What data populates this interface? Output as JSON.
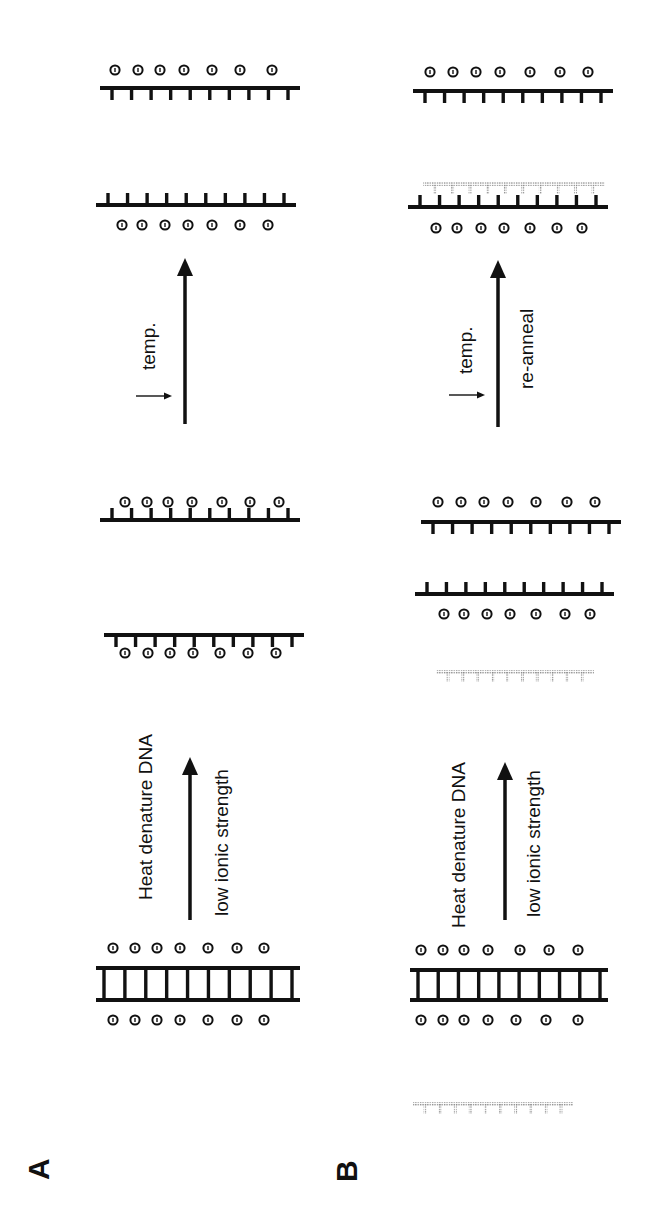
{
  "figure": {
    "width": 647,
    "height": 1213,
    "orientation": "rotated -90deg (reads bottom-to-top)",
    "colors": {
      "ink": "#111111",
      "stipple": "#8a8a8a",
      "background": "#ffffff"
    }
  },
  "panels": [
    {
      "id": "A",
      "letter": "A",
      "letter_pos": [
        22,
        1180
      ],
      "labels": [
        {
          "name": "heat-denature-label",
          "text": "Heat denature DNA",
          "pos": [
            135,
            900
          ]
        },
        {
          "name": "low-ionic-strength-label",
          "text": "low ionic strength",
          "pos": [
            211,
            916
          ]
        },
        {
          "name": "temp-label",
          "text": "temp.",
          "pos": [
            138,
            370
          ]
        }
      ],
      "arrows": [
        {
          "name": "denature-arrow",
          "x": 190,
          "y1": 920,
          "y2": 757,
          "width": 3.5
        },
        {
          "name": "cool-arrow",
          "x": 185,
          "y1": 424,
          "y2": 258,
          "width": 3.5
        }
      ],
      "small_arrows": [
        {
          "name": "temp-decrease-arrow",
          "x1": 136,
          "x2": 172,
          "y": 396
        }
      ],
      "duplexes": [
        {
          "name": "double-stranded-dna",
          "x1": 96,
          "x2": 300,
          "y_top": 968,
          "y_bot": 1000,
          "rungs": 10,
          "ions_above": [
            113,
            135,
            157,
            180,
            208,
            237,
            264
          ],
          "ions_above_y": 948,
          "ions_below": [
            113,
            135,
            157,
            180,
            208,
            237,
            264
          ],
          "ions_below_y": 1020
        }
      ],
      "strands": [
        {
          "name": "single-strand-lower",
          "x1": 100,
          "x2": 300,
          "y": 520,
          "teeth": "up",
          "tooth_len": 12,
          "count": 10,
          "style": "solid",
          "ions": [
            125,
            148,
            170,
            193,
            220,
            248,
            276
          ],
          "ions_side": "below",
          "ions_y": 653
        },
        {
          "name": "single-strand-upper",
          "x1": 104,
          "x2": 304,
          "y": 635,
          "teeth": "down",
          "tooth_len": 12,
          "count": 10,
          "style": "solid",
          "ions": [
            125,
            147,
            168,
            192,
            222,
            250,
            279
          ],
          "ions_side": "above",
          "ions_y": 502
        },
        {
          "name": "renatured-strand-lower",
          "x1": 96,
          "x2": 296,
          "y": 205,
          "teeth": "up",
          "tooth_len": 12,
          "count": 10,
          "style": "solid",
          "ions": [
            122,
            142,
            165,
            188,
            212,
            240,
            268
          ],
          "ions_side": "below",
          "ions_y": 225
        },
        {
          "name": "renatured-strand-upper",
          "x1": 100,
          "x2": 300,
          "y": 88,
          "teeth": "down",
          "tooth_len": 12,
          "count": 10,
          "style": "solid",
          "ions": [
            115,
            138,
            160,
            184,
            212,
            240,
            272
          ],
          "ions_side": "above",
          "ions_y": 70
        }
      ]
    },
    {
      "id": "B",
      "letter": "B",
      "letter_pos": [
        330,
        1182
      ],
      "labels": [
        {
          "name": "heat-denature-label",
          "text": "Heat denature DNA",
          "pos": [
            448,
            928
          ]
        },
        {
          "name": "low-ionic-strength-label",
          "text": "low ionic strength",
          "pos": [
            523,
            917
          ]
        },
        {
          "name": "temp-label",
          "text": "temp.",
          "pos": [
            455,
            374
          ]
        },
        {
          "name": "re-anneal-label",
          "text": "re-anneal",
          "pos": [
            516,
            389
          ]
        }
      ],
      "arrows": [
        {
          "name": "denature-arrow",
          "x": 505,
          "y1": 920,
          "y2": 762,
          "width": 3.5
        },
        {
          "name": "reanneal-arrow",
          "x": 498,
          "y1": 427,
          "y2": 260,
          "width": 3.5
        }
      ],
      "small_arrows": [
        {
          "name": "temp-decrease-arrow",
          "x1": 449,
          "x2": 485,
          "y": 395
        }
      ],
      "duplexes": [
        {
          "name": "double-stranded-dna",
          "x1": 410,
          "x2": 608,
          "y_top": 970,
          "y_bot": 1000,
          "rungs": 10,
          "ions_above": [
            421,
            443,
            464,
            488,
            520,
            549,
            578
          ],
          "ions_above_y": 950,
          "ions_below": [
            421,
            443,
            464,
            488,
            516,
            546,
            578
          ],
          "ions_below_y": 1020
        }
      ],
      "strands": [
        {
          "name": "probe-strand-left",
          "x1": 413,
          "x2": 573,
          "y": 1104,
          "teeth": "down",
          "tooth_len": 10,
          "count": 10,
          "style": "stipple",
          "ions": [],
          "ions_side": "none",
          "ions_y": 0
        },
        {
          "name": "probe-strand-middle",
          "x1": 436,
          "x2": 594,
          "y": 672,
          "teeth": "down",
          "tooth_len": 10,
          "count": 10,
          "style": "stipple",
          "ions": [],
          "ions_side": "none",
          "ions_y": 0
        },
        {
          "name": "single-strand-lower",
          "x1": 415,
          "x2": 614,
          "y": 594,
          "teeth": "up",
          "tooth_len": 12,
          "count": 10,
          "style": "solid",
          "ions": [
            444,
            464,
            487,
            510,
            536,
            565,
            590
          ],
          "ions_side": "below",
          "ions_y": 614
        },
        {
          "name": "single-strand-upper",
          "x1": 421,
          "x2": 621,
          "y": 522,
          "teeth": "down",
          "tooth_len": 12,
          "count": 10,
          "style": "solid",
          "ions": [
            438,
            461,
            484,
            508,
            536,
            567,
            595
          ],
          "ions_side": "above",
          "ions_y": 502
        },
        {
          "name": "hybrid-strand-target",
          "x1": 408,
          "x2": 608,
          "y": 207,
          "teeth": "up",
          "tooth_len": 12,
          "count": 10,
          "style": "solid",
          "ions": [
            436,
            457,
            481,
            504,
            530,
            557,
            582
          ],
          "ions_side": "below",
          "ions_y": 228
        },
        {
          "name": "hybrid-strand-probe",
          "x1": 423,
          "x2": 605,
          "y": 184,
          "teeth": "down",
          "tooth_len": 10,
          "count": 10,
          "style": "stipple",
          "ions": [],
          "ions_side": "none",
          "ions_y": 0
        },
        {
          "name": "renatured-strand-upper",
          "x1": 413,
          "x2": 613,
          "y": 91,
          "teeth": "down",
          "tooth_len": 12,
          "count": 10,
          "style": "solid",
          "ions": [
            430,
            453,
            476,
            500,
            530,
            560,
            588
          ],
          "ions_side": "above",
          "ions_y": 72
        }
      ]
    }
  ]
}
